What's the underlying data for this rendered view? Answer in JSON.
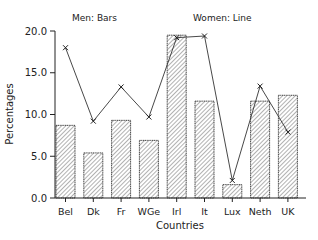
{
  "chart_data": {
    "type": "bar",
    "title": "",
    "annotations": [
      "Men: Bars",
      "Women: Line"
    ],
    "xlabel": "Countries",
    "ylabel": "Percentages",
    "ylim": [
      0,
      20
    ],
    "yticks": [
      "0.0",
      "5.0",
      "10.0",
      "15.0",
      "20.0"
    ],
    "grid": false,
    "legend": "none (text annotations at top)",
    "categories": [
      "Bel",
      "Dk",
      "Fr",
      "WGe",
      "Irl",
      "It",
      "Lux",
      "Neth",
      "UK"
    ],
    "series": [
      {
        "name": "Men",
        "type": "bar",
        "values": [
          8.7,
          5.4,
          9.3,
          6.9,
          19.5,
          11.6,
          1.6,
          11.6,
          12.3
        ]
      },
      {
        "name": "Women",
        "type": "line",
        "marker": "x",
        "values": [
          18.0,
          9.2,
          13.3,
          9.7,
          19.2,
          19.4,
          2.1,
          13.4,
          7.9
        ]
      }
    ]
  },
  "labels": {
    "men": "Men: Bars",
    "women": "Women: Line",
    "xlabel": "Countries",
    "ylabel": "Percentages"
  }
}
